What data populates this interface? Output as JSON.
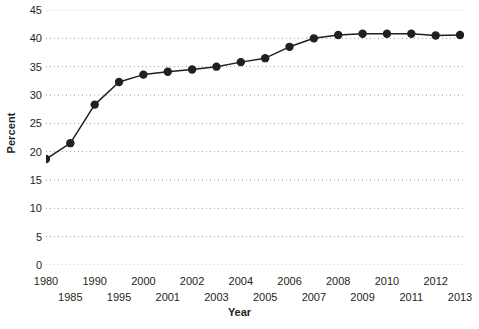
{
  "chart_data": {
    "type": "line",
    "title": "",
    "xlabel": "Year",
    "ylabel": "Percent",
    "grid": true,
    "legend": false,
    "ylim": [
      0,
      45
    ],
    "yticks": [
      0,
      5,
      10,
      15,
      20,
      25,
      30,
      35,
      40,
      45
    ],
    "ytick_labels": [
      "0",
      "5",
      "10",
      "15",
      "20",
      "25",
      "30",
      "35",
      "40",
      "45"
    ],
    "x_axis_note": "irregular spacing: 5-year steps 1980-2000, then annual 2000-2013",
    "xticks": [
      "1980",
      "1985",
      "1990",
      "1995",
      "2000",
      "2001",
      "2002",
      "2003",
      "2004",
      "2005",
      "2006",
      "2007",
      "2008",
      "2009",
      "2010",
      "2011",
      "2012",
      "2013"
    ],
    "categories": [
      1980,
      1985,
      1990,
      1995,
      2000,
      2001,
      2002,
      2003,
      2004,
      2005,
      2006,
      2007,
      2008,
      2009,
      2010,
      2011,
      2012,
      2013
    ],
    "values": [
      18.7,
      21.5,
      28.3,
      32.3,
      33.6,
      34.1,
      34.5,
      35.0,
      35.8,
      36.5,
      38.5,
      40.0,
      40.6,
      40.8,
      40.8,
      40.8,
      40.5,
      40.6
    ],
    "marker": "filled-circle",
    "line_color": "#231f20",
    "marker_color": "#231f20",
    "grid_color": "#9a9a9a",
    "background_color": "#ffffff"
  },
  "axes": {
    "y_title": "Percent",
    "x_title": "Year"
  }
}
